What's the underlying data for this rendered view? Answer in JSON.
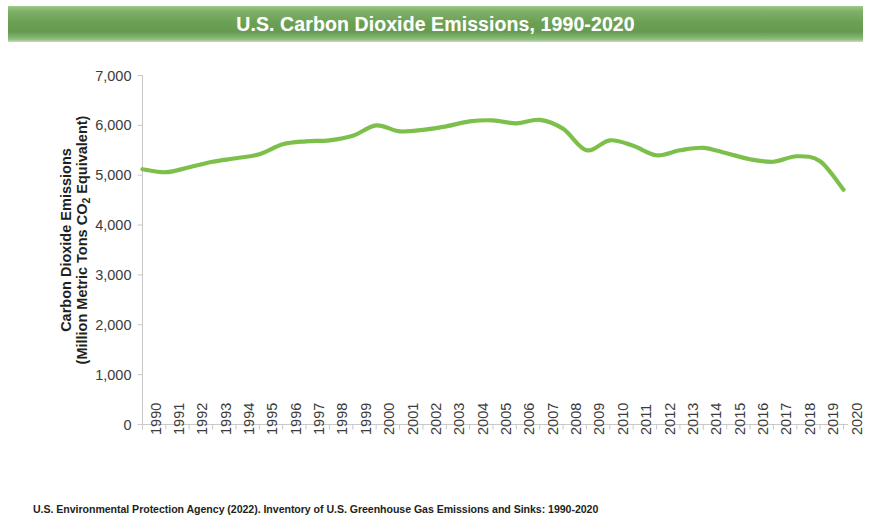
{
  "banner": {
    "title": "U.S. Carbon Dioxide Emissions, 1990-2020",
    "background_color": "#6ba054",
    "text_color": "#ffffff"
  },
  "caption": {
    "text": "U.S. Environmental Protection Agency (2022). Inventory of U.S. Greenhouse Gas Emissions and Sinks: 1990-2020"
  },
  "axis_titles": {
    "y_line1": "Carbon Dioxide Emissions",
    "y_line2_before": "(Million Metric Tons CO",
    "y_line2_sub": "2",
    "y_line2_after": " Equivalent)"
  },
  "chart_data": {
    "type": "line",
    "title": "U.S. Carbon Dioxide Emissions, 1990-2020",
    "xlabel": "",
    "ylabel": "Carbon Dioxide Emissions (Million Metric Tons CO2 Equivalent)",
    "series_color": "#7dbf4b",
    "grid": false,
    "legend": "none",
    "ylim": [
      0,
      7000
    ],
    "ytick_labels": [
      "7,000",
      "6,000",
      "5,000",
      "4,000",
      "3,000",
      "2,000",
      "1,000",
      "0"
    ],
    "ytick_values": [
      7000,
      6000,
      5000,
      4000,
      3000,
      2000,
      1000,
      0
    ],
    "categories": [
      "1990",
      "1991",
      "1992",
      "1993",
      "1994",
      "1995",
      "1996",
      "1997",
      "1998",
      "1999",
      "2000",
      "2001",
      "2002",
      "2003",
      "2004",
      "2005",
      "2006",
      "2007",
      "2008",
      "2009",
      "2010",
      "2011",
      "2012",
      "2013",
      "2014",
      "2015",
      "2016",
      "2017",
      "2018",
      "2019",
      "2020"
    ],
    "series": [
      {
        "name": "U.S. Carbon Dioxide Emissions",
        "values": [
          5120,
          5060,
          5160,
          5270,
          5340,
          5420,
          5620,
          5680,
          5700,
          5790,
          6000,
          5880,
          5910,
          5980,
          6080,
          6100,
          6040,
          6110,
          5930,
          5500,
          5700,
          5590,
          5400,
          5500,
          5550,
          5440,
          5320,
          5270,
          5380,
          5280,
          4710
        ]
      }
    ]
  }
}
